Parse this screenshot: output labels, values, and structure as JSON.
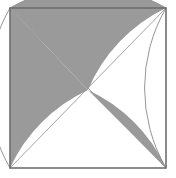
{
  "figure": {
    "type": "geometric-diagram",
    "canvas": {
      "width": 176,
      "height": 178
    },
    "colors": {
      "background": "#ffffff",
      "shade": "#9a9a9a",
      "frame_stroke": "#6e6e6e",
      "diagonal_stroke": "#9a9a9a",
      "arc_stroke": "#8a8a8a"
    },
    "square": {
      "label": "outer-square",
      "left": 10,
      "top": 8,
      "right": 166,
      "bottom": 168,
      "width": 156,
      "height": 160,
      "stroke_width": 1.6
    },
    "corners": {
      "top_left": [
        10,
        8
      ],
      "top_right": [
        166,
        8
      ],
      "bottom_left": [
        10,
        168
      ],
      "bottom_right": [
        166,
        168
      ]
    },
    "center": [
      88,
      88
    ],
    "crossing_point": [
      88,
      90
    ],
    "diagonals": [
      {
        "label": "diagonal-tl-br",
        "from": [
          10,
          8
        ],
        "to": [
          166,
          168
        ]
      },
      {
        "label": "diagonal-bl-tr",
        "from": [
          10,
          168
        ],
        "to": [
          166,
          8
        ]
      }
    ],
    "arcs": [
      {
        "label": "arc-left-bulge",
        "description": "quarter arc from top-left corner to bottom-left corner bulging right",
        "from": [
          10,
          8
        ],
        "to": [
          10,
          168
        ],
        "radius": 160,
        "sweep": 1
      },
      {
        "label": "arc-top-bulge",
        "description": "quarter arc from top-left corner to top-right corner bulging down",
        "from": [
          10,
          8
        ],
        "to": [
          166,
          8
        ],
        "radius": 156,
        "sweep": 0
      },
      {
        "label": "arc-right-bulge",
        "description": "quarter arc from top-right corner to bottom-right corner bulging left",
        "from": [
          166,
          8
        ],
        "to": [
          166,
          168
        ],
        "radius": 160,
        "sweep": 0
      }
    ],
    "shaded_regions": [
      {
        "label": "region-upper-left-wedge",
        "description": "gray wedge from top-left corner down the left side to bottom-left, bounded by left edge, arc and diagonal"
      },
      {
        "label": "region-upper-middle-wedge",
        "description": "gray band from the center crossing sweeping up-right to the top-right corner"
      },
      {
        "label": "region-lower-right-crescent",
        "description": "gray crescent from center crossing down to the bottom-right corner"
      }
    ]
  }
}
